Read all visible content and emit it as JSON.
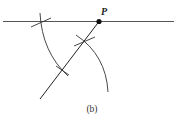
{
  "figure": {
    "caption": "(b)",
    "point_label": "P",
    "colors": {
      "stroke": "#333333",
      "bottom_line_left": "#3a3a3a",
      "bottom_line_mid": "#c0506a",
      "bottom_line_right": "#3a8a8a"
    },
    "elements": [
      "top-line",
      "bottom-line",
      "transversal",
      "point-P",
      "arc-left",
      "arc-right",
      "tick-marks"
    ]
  }
}
